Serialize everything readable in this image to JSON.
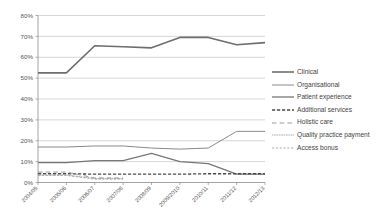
{
  "chart_data": {
    "type": "line",
    "title": "",
    "subtitle": "",
    "xlabel": "",
    "ylabel": "",
    "categories": [
      "2004/05",
      "2005/06",
      "2006/07",
      "2007/08",
      "2008/09",
      "2009/2010",
      "2010/11",
      "2011/12",
      "2012/13"
    ],
    "ylim": [
      0,
      80
    ],
    "ytick_labels": [
      "0%",
      "10%",
      "20%",
      "30%",
      "40%",
      "50%",
      "60%",
      "70%",
      "80%"
    ],
    "ytick_values": [
      0,
      10,
      20,
      30,
      40,
      50,
      60,
      70,
      80
    ],
    "grid": "horizontal",
    "legend_position": "right",
    "series": [
      {
        "name": "Clinical",
        "style": "solid",
        "width": 1.6,
        "color": "#6e6e6e",
        "values": [
          52.5,
          52.5,
          65.5,
          65.0,
          64.5,
          69.5,
          69.5,
          66.0,
          67.0
        ]
      },
      {
        "name": "Organisational",
        "style": "solid",
        "width": 1.0,
        "color": "#8a8a8a",
        "values": [
          17.0,
          17.0,
          17.5,
          17.5,
          16.5,
          16.0,
          16.5,
          24.5,
          24.5
        ]
      },
      {
        "name": "Patient experience",
        "style": "solid",
        "width": 1.3,
        "color": "#777777",
        "values": [
          9.5,
          9.5,
          10.5,
          10.5,
          14.0,
          10.0,
          9.0,
          4.0,
          4.0
        ]
      },
      {
        "name": "Additional services",
        "style": "dashed",
        "width": 1.3,
        "color": "#4a4a4a",
        "values": [
          4.2,
          4.2,
          4.0,
          4.0,
          4.0,
          4.0,
          4.2,
          4.2,
          4.2
        ]
      },
      {
        "name": "Holistic care",
        "style": "longdash",
        "width": 1.0,
        "color": "#9a9a9a",
        "values": [
          5.0,
          5.0,
          2.2,
          2.2,
          null,
          null,
          null,
          null,
          null
        ]
      },
      {
        "name": "Quality practice payment",
        "style": "dotted",
        "width": 0.9,
        "color": "#a5a5a5",
        "values": [
          3.6,
          3.6,
          1.9,
          1.9,
          null,
          null,
          null,
          null,
          null
        ]
      },
      {
        "name": "Access bonus",
        "style": "shortdash",
        "width": 0.9,
        "color": "#a0a0a0",
        "values": [
          3.4,
          3.4,
          1.6,
          1.6,
          null,
          null,
          null,
          null,
          null
        ]
      }
    ]
  },
  "legend": {
    "items": [
      {
        "label": "Clinical"
      },
      {
        "label": "Organisational"
      },
      {
        "label": "Patient experience"
      },
      {
        "label": "Additional services"
      },
      {
        "label": "Holistic care"
      },
      {
        "label": "Quality practice payment"
      },
      {
        "label": "Access bonus"
      }
    ]
  },
  "axes": {
    "y_ticks": [
      "80%",
      "70%",
      "60%",
      "50%",
      "40%",
      "30%",
      "20%",
      "10%",
      "0%"
    ],
    "x_ticks": [
      "2004/05",
      "2005/06",
      "2006/07",
      "2007/08",
      "2008/09",
      "2009/2010",
      "2010/11",
      "2011/12",
      "2012/13"
    ]
  }
}
